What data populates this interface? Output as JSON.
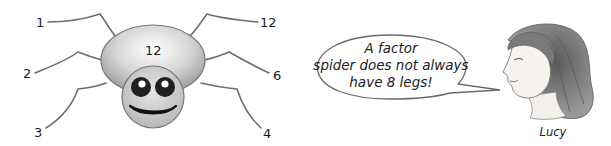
{
  "spider": {
    "body_number": "12",
    "legs": {
      "left_top": "1",
      "left_middle": "2",
      "left_bottom": "3",
      "right_top": "12",
      "right_middle": "6",
      "right_bottom": "4"
    },
    "colors": {
      "body_light": "#f4f4f4",
      "body_dark": "#9a9a9a",
      "outline": "#777777",
      "legs": "#6e6e6e",
      "eyes": "#1f1f1f",
      "mouth": "#111111"
    }
  },
  "speech_bubble": {
    "line1": "A factor",
    "line2": "spider does not always",
    "line3": "have 8 legs!"
  },
  "character": {
    "name": "Lucy"
  }
}
